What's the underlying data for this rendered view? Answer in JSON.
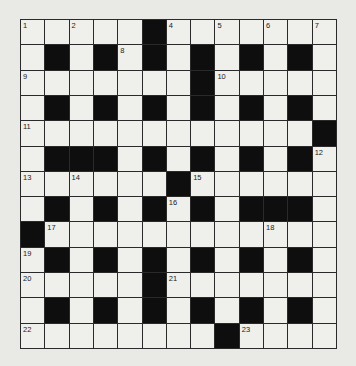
{
  "crossword": {
    "rows": 13,
    "cols": 13,
    "colors": {
      "background": "#e9e9e6",
      "cell": "#efefec",
      "block": "#0e0e0e",
      "grid_line": "#2a2a2a"
    },
    "layout": [
      ".....#.......",
      ".#.#.#.#.#.#.",
      ".......#.....",
      ".#.#.#.#.#.#.",
      "............#",
      ".###.#.#.#.#.",
      "......#......",
      ".#.#.#.#.###.",
      "#............",
      ".#.#.#.#.#.#.",
      ".....#.......",
      ".#.#.#.#.#.#.",
      "........#...."
    ],
    "numbers": [
      {
        "row": 0,
        "col": 0,
        "n": "1"
      },
      {
        "row": 0,
        "col": 2,
        "n": "2"
      },
      {
        "row": 0,
        "col": 5,
        "n": "3"
      },
      {
        "row": 0,
        "col": 6,
        "n": "4"
      },
      {
        "row": 0,
        "col": 8,
        "n": "5"
      },
      {
        "row": 0,
        "col": 10,
        "n": "6"
      },
      {
        "row": 0,
        "col": 12,
        "n": "7"
      },
      {
        "row": 1,
        "col": 4,
        "n": "8"
      },
      {
        "row": 2,
        "col": 0,
        "n": "9"
      },
      {
        "row": 2,
        "col": 8,
        "n": "10"
      },
      {
        "row": 4,
        "col": 0,
        "n": "11"
      },
      {
        "row": 5,
        "col": 12,
        "n": "12"
      },
      {
        "row": 6,
        "col": 0,
        "n": "13"
      },
      {
        "row": 6,
        "col": 2,
        "n": "14"
      },
      {
        "row": 6,
        "col": 7,
        "n": "15"
      },
      {
        "row": 7,
        "col": 6,
        "n": "16"
      },
      {
        "row": 8,
        "col": 1,
        "n": "17"
      },
      {
        "row": 8,
        "col": 10,
        "n": "18"
      },
      {
        "row": 9,
        "col": 0,
        "n": "19"
      },
      {
        "row": 10,
        "col": 0,
        "n": "20"
      },
      {
        "row": 10,
        "col": 6,
        "n": "21"
      },
      {
        "row": 12,
        "col": 0,
        "n": "22"
      },
      {
        "row": 12,
        "col": 9,
        "n": "23"
      }
    ]
  }
}
